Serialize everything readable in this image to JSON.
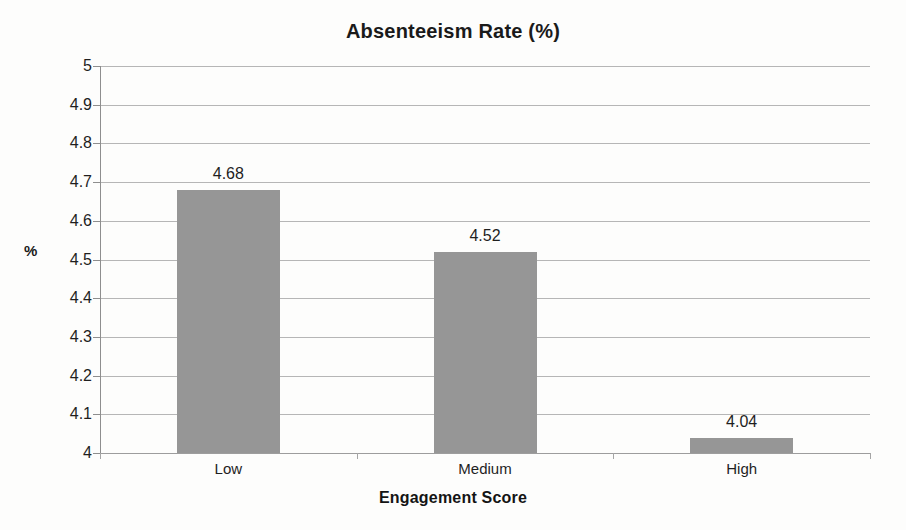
{
  "chart_data": {
    "type": "bar",
    "title": "Absenteeism Rate (%)",
    "xlabel": "Engagement Score",
    "ylabel": "%",
    "categories": [
      "Low",
      "Medium",
      "High"
    ],
    "values": [
      4.68,
      4.52,
      4.04
    ],
    "value_labels": [
      "4.68",
      "4.52",
      "4.04"
    ],
    "ylim": [
      4,
      5
    ],
    "ytick_step": 0.1,
    "ytick_labels": [
      "5",
      "4.9",
      "4.8",
      "4.7",
      "4.6",
      "4.5",
      "4.4",
      "4.3",
      "4.2",
      "4.1",
      "4"
    ],
    "ytick_values": [
      5,
      4.9,
      4.8,
      4.7,
      4.6,
      4.5,
      4.4,
      4.3,
      4.2,
      4.1,
      4
    ],
    "grid": true,
    "grid_axis": "y",
    "legend": false,
    "legend_position": "none",
    "bar_color": "#969696",
    "gridline_color": "#b6b6b6",
    "axis_color": "#8e8e8e",
    "background_color": "#fdfdfc",
    "text_color": "#1f1f1f",
    "data_labels_shown": true,
    "series": [
      {
        "name": "Absenteeism Rate (%)",
        "values": [
          4.68,
          4.52,
          4.04
        ]
      }
    ]
  }
}
